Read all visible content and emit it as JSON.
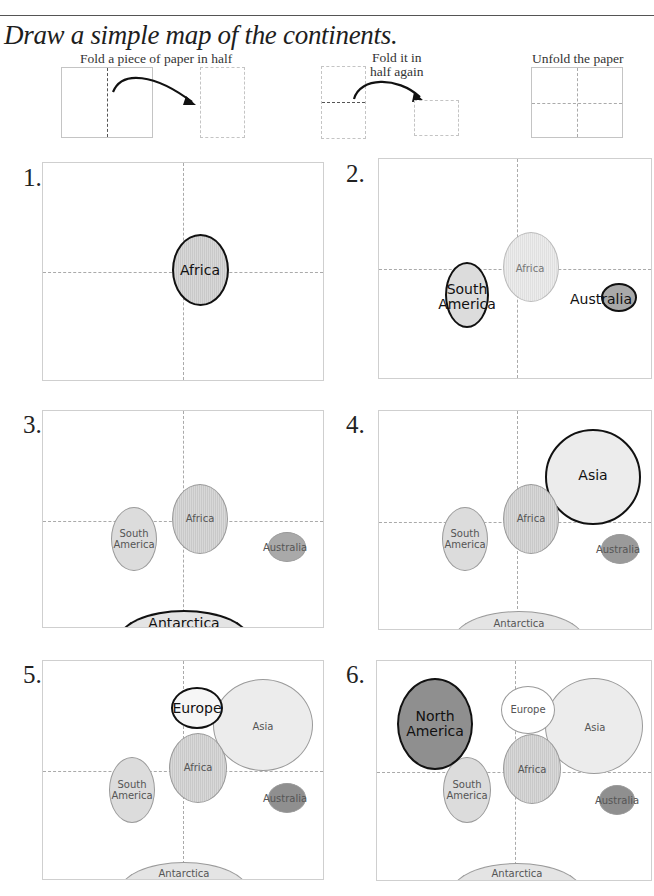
{
  "header": {
    "title": "Draw a simple map of the continents."
  },
  "instructions": {
    "steps": [
      {
        "caption": "Fold a piece of paper in half"
      },
      {
        "caption_line1": "Fold it in",
        "caption_line2": "half again"
      },
      {
        "caption": "Unfold the paper"
      }
    ]
  },
  "panels": [
    {
      "number": "1.",
      "continents": [
        {
          "name": "Africa",
          "highlight": true
        }
      ]
    },
    {
      "number": "2.",
      "continents": [
        {
          "name": "Africa",
          "highlight": false
        },
        {
          "name_line1": "South",
          "name_line2": "America",
          "highlight": true
        },
        {
          "name": "Australia",
          "highlight": true
        }
      ]
    },
    {
      "number": "3.",
      "continents": [
        {
          "name_line1": "South",
          "name_line2": "America",
          "highlight": false
        },
        {
          "name": "Africa",
          "highlight": false
        },
        {
          "name": "Australia",
          "highlight": false
        },
        {
          "name": "Antarctica",
          "highlight": true
        }
      ]
    },
    {
      "number": "4.",
      "continents": [
        {
          "name": "Asia",
          "highlight": true
        },
        {
          "name_line1": "South",
          "name_line2": "America",
          "highlight": false
        },
        {
          "name": "Africa",
          "highlight": false
        },
        {
          "name": "Australia",
          "highlight": false
        },
        {
          "name": "Antarctica",
          "highlight": false
        }
      ]
    },
    {
      "number": "5.",
      "continents": [
        {
          "name": "Europe",
          "highlight": true
        },
        {
          "name": "Asia",
          "highlight": false
        },
        {
          "name": "Africa",
          "highlight": false
        },
        {
          "name_line1": "South",
          "name_line2": "America",
          "highlight": false
        },
        {
          "name": "Australia",
          "highlight": false
        },
        {
          "name": "Antarctica",
          "highlight": false
        }
      ]
    },
    {
      "number": "6.",
      "continents": [
        {
          "name_line1": "North",
          "name_line2": "America",
          "highlight": true
        },
        {
          "name": "Europe",
          "highlight": false
        },
        {
          "name": "Asia",
          "highlight": false
        },
        {
          "name": "Africa",
          "highlight": false
        },
        {
          "name_line1": "South",
          "name_line2": "America",
          "highlight": false
        },
        {
          "name": "Australia",
          "highlight": false
        },
        {
          "name": "Antarctica",
          "highlight": false
        }
      ]
    }
  ],
  "colors": {
    "outline_highlight": "#111111",
    "outline_faint": "#9a9a9a",
    "fold_line": "#aaaaaa",
    "north_america_fill": "#8f8f8f",
    "australia_fill": "#a9a9a9"
  }
}
